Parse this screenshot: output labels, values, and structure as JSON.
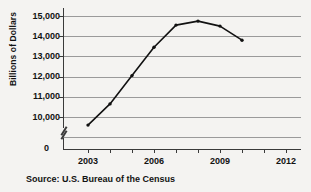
{
  "chart_data": {
    "type": "line",
    "title": "",
    "xlabel": "",
    "ylabel": "Billions of Dollars",
    "source": "Source: U.S. Bureau of the Census",
    "grid": true,
    "legend": "none",
    "axis_break": true,
    "xlim": [
      2002,
      2013
    ],
    "ylim": [
      9000,
      15000
    ],
    "ytick_labels": [
      "15,000",
      "14,000",
      "13,000",
      "12,000",
      "11,000",
      "10,000"
    ],
    "ytick_values": [
      15000,
      14000,
      13000,
      12000,
      11000,
      10000
    ],
    "zero_label": "0",
    "xtick_labels": [
      "2003",
      "2006",
      "2009",
      "2012"
    ],
    "xtick_values": [
      2003,
      2006,
      2009,
      2012
    ],
    "xtick_all": [
      2003,
      2004,
      2005,
      2006,
      2007,
      2008,
      2009,
      2010,
      2011,
      2012
    ],
    "x": [
      2003,
      2004,
      2005,
      2006,
      2007,
      2008,
      2009,
      2010
    ],
    "values": [
      9600,
      10650,
      12050,
      13450,
      14550,
      14750,
      14500,
      13800
    ],
    "series": [
      {
        "name": "Billions of Dollars",
        "color": "#111111",
        "points": [
          {
            "x": 2003,
            "y": 9600
          },
          {
            "x": 2004,
            "y": 10650
          },
          {
            "x": 2005,
            "y": 12050
          },
          {
            "x": 2006,
            "y": 13450
          },
          {
            "x": 2007,
            "y": 14550
          },
          {
            "x": 2008,
            "y": 14750
          },
          {
            "x": 2009,
            "y": 14500
          },
          {
            "x": 2010,
            "y": 13800
          }
        ]
      }
    ]
  },
  "colors": {
    "background": "#f4f3f1",
    "grid": "#9a9a9a",
    "axis": "#3a3a3a",
    "line": "#111111",
    "text": "#121212"
  }
}
